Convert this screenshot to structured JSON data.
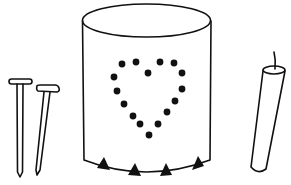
{
  "illustration": {
    "subject": "Tin can lantern craft supplies",
    "colors": {
      "stroke": "#111111",
      "fill": "#111111",
      "background": "#ffffff"
    },
    "objects": [
      {
        "name": "nail",
        "count": 2
      },
      {
        "name": "tin-can",
        "pattern": "heart of punched holes",
        "holes": 16,
        "bottom_notches": 4
      },
      {
        "name": "candle",
        "count": 1
      }
    ],
    "heart_dots": [
      [
        122,
        64
      ],
      [
        136,
        62
      ],
      [
        160,
        62
      ],
      [
        174,
        63
      ],
      [
        148,
        73
      ],
      [
        114,
        77
      ],
      [
        182,
        73
      ],
      [
        117,
        91
      ],
      [
        182,
        89
      ],
      [
        124,
        104
      ],
      [
        175,
        101
      ],
      [
        133,
        116
      ],
      [
        167,
        112
      ],
      [
        140,
        124
      ],
      [
        158,
        124
      ],
      [
        149,
        135
      ]
    ]
  }
}
